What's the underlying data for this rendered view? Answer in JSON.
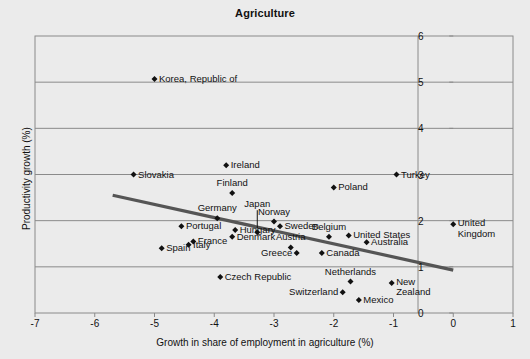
{
  "chart_data": {
    "type": "scatter",
    "title": "Agriculture",
    "xlabel": "Growth in share of employment in agriculture (%)",
    "ylabel": "Productivity growth (%)",
    "xlim": [
      -7,
      1
    ],
    "ylim": [
      0,
      6
    ],
    "xticks": [
      "-7",
      "-6",
      "-5",
      "-4",
      "-3",
      "-2",
      "-1",
      "0",
      "1"
    ],
    "yticks": [
      "0",
      "1",
      "2",
      "3",
      "4",
      "5",
      "6"
    ],
    "xtick_values": [
      -7,
      -6,
      -5,
      -4,
      -3,
      -2,
      -1,
      0,
      1
    ],
    "ytick_values": [
      0,
      1,
      2,
      3,
      4,
      5,
      6
    ],
    "grid": "horizontal",
    "legend": "none",
    "marker": "diamond",
    "marker_color": "#111111",
    "trendline": {
      "label": "linear trend",
      "color": "#555555",
      "x_start": -5.7,
      "y_start": 2.55,
      "x_end": 0.0,
      "y_end": 0.93
    },
    "points": [
      {
        "name": "Korea, Republic of",
        "x": -5.0,
        "y": 5.07,
        "label_pos": "right"
      },
      {
        "name": "Slovakia",
        "x": -5.35,
        "y": 3.0,
        "label_pos": "right"
      },
      {
        "name": "Ireland",
        "x": -3.8,
        "y": 3.2,
        "label_pos": "right"
      },
      {
        "name": "Turkey",
        "x": -0.95,
        "y": 3.0,
        "label_pos": "right"
      },
      {
        "name": "Finland",
        "x": -3.7,
        "y": 2.6,
        "label_pos": "above"
      },
      {
        "name": "Poland",
        "x": -2.0,
        "y": 2.72,
        "label_pos": "right"
      },
      {
        "name": "Germany",
        "x": -3.95,
        "y": 2.05,
        "label_pos": "above"
      },
      {
        "name": "Norway",
        "x": -3.0,
        "y": 1.98,
        "label_pos": "above"
      },
      {
        "name": "Sweden",
        "x": -2.9,
        "y": 1.88,
        "label_pos": "right"
      },
      {
        "name": "Japan",
        "x": -3.28,
        "y": 1.75,
        "label_pos": "leader"
      },
      {
        "name": "Portugal",
        "x": -4.55,
        "y": 1.88,
        "label_pos": "right"
      },
      {
        "name": "Hungary",
        "x": -3.65,
        "y": 1.8,
        "label_pos": "right"
      },
      {
        "name": "France",
        "x": -4.35,
        "y": 1.55,
        "label_pos": "right"
      },
      {
        "name": "Denmark",
        "x": -3.7,
        "y": 1.65,
        "label_pos": "right"
      },
      {
        "name": "Italy",
        "x": -4.43,
        "y": 1.48,
        "label_pos": "right"
      },
      {
        "name": "Spain",
        "x": -4.88,
        "y": 1.4,
        "label_pos": "right"
      },
      {
        "name": "Belgium",
        "x": -2.08,
        "y": 1.65,
        "label_pos": "above"
      },
      {
        "name": "United States",
        "x": -1.75,
        "y": 1.68,
        "label_pos": "right"
      },
      {
        "name": "Australia",
        "x": -1.45,
        "y": 1.53,
        "label_pos": "right"
      },
      {
        "name": "Austria",
        "x": -2.72,
        "y": 1.42,
        "label_pos": "above"
      },
      {
        "name": "Greece",
        "x": -2.62,
        "y": 1.3,
        "label_pos": "left"
      },
      {
        "name": "Canada",
        "x": -2.2,
        "y": 1.3,
        "label_pos": "right"
      },
      {
        "name": "United Kingdom",
        "x": 0.0,
        "y": 1.92,
        "label_pos": "right2"
      },
      {
        "name": "Czech Republic",
        "x": -3.9,
        "y": 0.78,
        "label_pos": "right"
      },
      {
        "name": "Netherlands",
        "x": -1.72,
        "y": 0.68,
        "label_pos": "above"
      },
      {
        "name": "New Zealand",
        "x": -1.03,
        "y": 0.65,
        "label_pos": "right2"
      },
      {
        "name": "Switzerland",
        "x": -1.85,
        "y": 0.45,
        "label_pos": "left"
      },
      {
        "name": "Mexico",
        "x": -1.58,
        "y": 0.28,
        "label_pos": "right"
      }
    ]
  }
}
